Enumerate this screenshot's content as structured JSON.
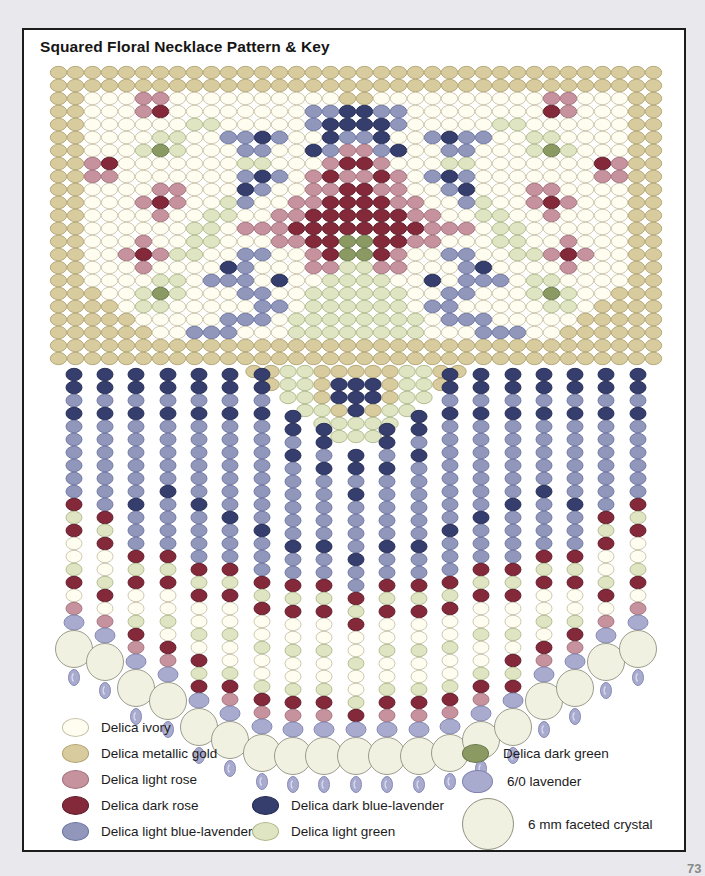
{
  "title": "Squared Floral Necklace Pattern & Key",
  "page_number": "73",
  "palette": {
    "i": {
      "name": "Delica ivory",
      "fill": "#fffdf0",
      "stroke": "#c6c2a9"
    },
    "g": {
      "name": "Delica metallic gold",
      "fill": "#d8cc9f",
      "stroke": "#b0a372"
    },
    "r": {
      "name": "Delica light rose",
      "fill": "#c6929d",
      "stroke": "#a26f7b"
    },
    "R": {
      "name": "Delica dark rose",
      "fill": "#84293a",
      "stroke": "#5e1a28"
    },
    "l": {
      "name": "Delica light blue-lavender",
      "fill": "#9097bb",
      "stroke": "#6b73a1"
    },
    "L": {
      "name": "Delica dark blue-lavender",
      "fill": "#353e6d",
      "stroke": "#232a52"
    },
    "e": {
      "name": "Delica light green",
      "fill": "#dfe5c2",
      "stroke": "#aeb98a"
    },
    "E": {
      "name": "Delica dark green",
      "fill": "#8b9a62",
      "stroke": "#68774a"
    },
    "v": {
      "name": "6/0 lavender",
      "fill": "#a9abce",
      "stroke": "#7f82b0"
    },
    "c": {
      "name": "6 mm faceted crystal",
      "fill": "#f1f1e2",
      "stroke": "#90917f"
    }
  },
  "band": {
    "cols": 36,
    "rows": 23,
    "x0": 48,
    "y0": 64,
    "dx": 17,
    "dy": 13,
    "bead_rx": 8.2,
    "bead_ry": 6.2,
    "mirrored": true,
    "half_rows": [
      "gggggggggggggggggg",
      "gggggggggggggggggg",
      "ggiiirriiiiiiiiiig",
      "ggiiirRiiiiiiiillL",
      "ggiiiiiieeiiiiilLL",
      "ggiiiieeiillLliiLl",
      "ggiiieEeiiilliiLlr",
      "ggrRiiiiiiieeiiirR",
      "ggrriiiiiiilLlirRr",
      "ggiiiirriiiLliirrR",
      "ggiiirRriieliirrRR",
      "ggiiiiriieeiirrRRR",
      "ggiiiiiieeirrrRRRR",
      "ggiiiriieeiiirrRRE",
      "ggiirRreeiilliirRE",
      "ggiiiriiiiLliiirre",
      "ggiiiieeillliLiiee",
      "gggiieEeiiilliieee",
      "ggggieeiiiiillieee",
      "gggggiiiiilllieeee",
      "ggggggiillliiieeee",
      "gggggggggggggggggg",
      "gggggggggggggggggg"
    ]
  },
  "triangle": {
    "cx": 354,
    "dx": 17,
    "dy": 13,
    "rows": [
      {
        "y": 369.5,
        "beads": "ggeegggggeegg"
      },
      {
        "y": 382.5,
        "beads": "geegLLLgeeg"
      },
      {
        "y": 395.5,
        "beads": "eegLLLgee"
      },
      {
        "y": 408.5,
        "beads": "eegLgee"
      },
      {
        "y": 421.5,
        "beads": "eeeee"
      },
      {
        "y": 434.5,
        "beads": "eee"
      }
    ]
  },
  "fringe": {
    "bead_rx": 8.0,
    "bead_ry": 6.2,
    "pitch": 13,
    "sixzero_rx": 10.0,
    "sixzero_ry": 7.5,
    "crystal_r": 18.5,
    "dangle_rx": 5.5,
    "dangle_ry": 8.0,
    "strands": [
      {
        "x": 72,
        "top": 366,
        "beads": "LLlLllllllReRiieRir"
      },
      {
        "x": 103,
        "top": 366,
        "beads": "LLlLlllllllReRiieRir"
      },
      {
        "x": 134,
        "top": 366,
        "beads": "LLlLllllllLlllReRiieRr"
      },
      {
        "x": 166,
        "top": 366,
        "beads": "LLlLlllllLllllReRiieiRr"
      },
      {
        "x": 197,
        "top": 366,
        "beads": "LLlLllllllLllllReRiieiReR"
      },
      {
        "x": 228,
        "top": 366,
        "beads": "LLlLlllllllLlllReRiieiieRr"
      },
      {
        "x": 260,
        "top": 366,
        "beads": "LLlLllllllllLlllReRiieiieRr"
      },
      {
        "x": 291,
        "top": 408,
        "beads": "LLlLllllllLllReRiieiieRr"
      },
      {
        "x": 322,
        "top": 421,
        "beads": "LLlLlllllLllReRiieiieRr"
      },
      {
        "x": 354,
        "top": 447,
        "beads": "LLlLllllLllReRiieiieR"
      },
      {
        "x": 385,
        "top": 421,
        "beads": "LLlLlllllLllReRiieiieRr"
      },
      {
        "x": 417,
        "top": 408,
        "beads": "LLlLllllllLllReRiieiieRr"
      },
      {
        "x": 448,
        "top": 366,
        "beads": "LLlLllllllllLlllReRiieiieRr"
      },
      {
        "x": 479,
        "top": 366,
        "beads": "LLlLlllllllLlllReRiieiieRr"
      },
      {
        "x": 511,
        "top": 366,
        "beads": "LLlLllllllLllllReRiieiReR"
      },
      {
        "x": 542,
        "top": 366,
        "beads": "LLlLlllllLllllReRiieiRr"
      },
      {
        "x": 573,
        "top": 366,
        "beads": "LLlLllllllLlllReRiieRr"
      },
      {
        "x": 604,
        "top": 366,
        "beads": "LLlLlllllllReRiieRir"
      },
      {
        "x": 636,
        "top": 366,
        "beads": "LLlLllllllReRiieRir"
      }
    ]
  },
  "key": {
    "columns": [
      {
        "entries": [
          {
            "color": "i",
            "swatch": "delica",
            "label": "Delica ivory"
          },
          {
            "color": "g",
            "swatch": "delica",
            "label": "Delica metallic gold"
          },
          {
            "color": "r",
            "swatch": "delica",
            "label": "Delica light rose"
          },
          {
            "color": "R",
            "swatch": "delica",
            "label": "Delica dark rose"
          },
          {
            "color": "l",
            "swatch": "delica",
            "label": "Delica light blue-lavender"
          }
        ]
      },
      {
        "entries": [
          {
            "color": "L",
            "swatch": "delica",
            "label": "Delica dark blue-lavender"
          },
          {
            "color": "e",
            "swatch": "delica",
            "label": "Delica light green"
          }
        ]
      },
      {
        "entries": [
          {
            "color": "E",
            "swatch": "delica",
            "label": "Delica dark green"
          },
          {
            "color": "v",
            "swatch": "sixzero",
            "label": "6/0 lavender"
          },
          {
            "color": "c",
            "swatch": "crystal",
            "label": "6 mm faceted crystal"
          }
        ]
      }
    ]
  }
}
